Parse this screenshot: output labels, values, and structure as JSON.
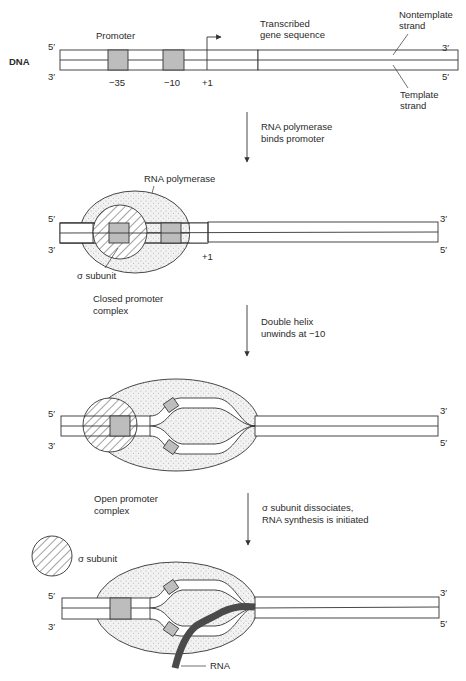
{
  "title_label": "DNA",
  "colors": {
    "line": "#333333",
    "promoter_box": "#bdbdbd",
    "polymerase_fill": "#ededed",
    "rna": "#4a4a4a",
    "background": "#ffffff"
  },
  "panel1": {
    "five_prime_left": "5′",
    "three_prime_left": "3′",
    "three_prime_right": "3′",
    "five_prime_right": "5′",
    "promoter_label": "Promoter",
    "minus35": "−35",
    "minus10": "−10",
    "plus1": "+1",
    "transcribed_line1": "Transcribed",
    "transcribed_line2": "gene sequence",
    "nontemplate_line1": "Nontemplate",
    "nontemplate_line2": "strand",
    "template_line1": "Template",
    "template_line2": "strand"
  },
  "step1": {
    "line1": "RNA polymerase",
    "line2": "binds promoter"
  },
  "panel2": {
    "five_prime_left": "5′",
    "three_prime_left": "3′",
    "three_prime_right": "3′",
    "five_prime_right": "5′",
    "polymerase_label": "RNA polymerase",
    "plus1": "+1",
    "sigma_label": "σ subunit",
    "complex_line1": "Closed promoter",
    "complex_line2": "complex"
  },
  "step2": {
    "line1": "Double helix",
    "line2": "unwinds at −10"
  },
  "panel3": {
    "five_prime_left": "5′",
    "three_prime_left": "3′",
    "three_prime_right": "3′",
    "five_prime_right": "5′",
    "complex_line1": "Open promoter",
    "complex_line2": "complex"
  },
  "step3": {
    "line1": "σ subunit dissociates,",
    "line2": "RNA synthesis is initiated"
  },
  "panel4": {
    "five_prime_left": "5′",
    "three_prime_left": "3′",
    "three_prime_right": "3′",
    "five_prime_right": "5′",
    "sigma_label": "σ subunit",
    "rna_label": "RNA"
  }
}
